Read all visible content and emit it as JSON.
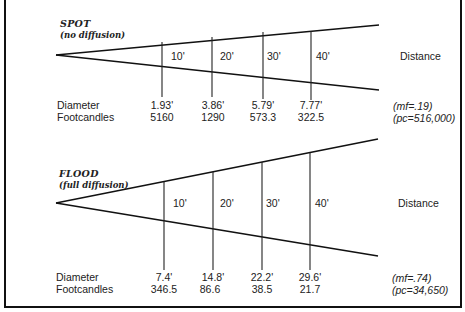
{
  "diagrams": [
    {
      "id": "spot",
      "title": "SPOT",
      "subtitle": "(no diffusion)",
      "distance_label": "Distance",
      "row_labels": [
        "Diameter",
        "Footcandles"
      ],
      "distances": [
        "10'",
        "20'",
        "30'",
        "40'"
      ],
      "diameters": [
        "1.93'",
        "3.86'",
        "5.79'",
        "7.77'"
      ],
      "footcandles": [
        "5160",
        "1290",
        "573.3",
        "322.5"
      ],
      "mf": "(mf=.19)",
      "pc": "(pc=516,000)"
    },
    {
      "id": "flood",
      "title": "FLOOD",
      "subtitle": "(full diffusion)",
      "distance_label": "Distance",
      "row_labels": [
        "Diameter",
        "Footcandles"
      ],
      "distances": [
        "10'",
        "20'",
        "30'",
        "40'"
      ],
      "diameters": [
        "7.4'",
        "14.8'",
        "22.2'",
        "29.6'"
      ],
      "footcandles": [
        "346.5",
        "86.6",
        "38.5",
        "21.7"
      ],
      "mf": "(mf=.74)",
      "pc": "(pc=34,650)"
    }
  ]
}
